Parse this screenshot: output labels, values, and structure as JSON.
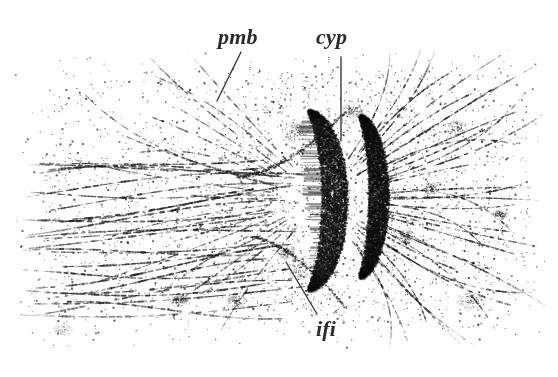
{
  "figure": {
    "kind": "stippled-histological-drawing",
    "width": 558,
    "height": 377,
    "background_color": "#ffffff",
    "ink_color": "#2b2b2b",
    "dark_mass_color": "#1a1a1a"
  },
  "labels": [
    {
      "id": "pmb",
      "text": "pmb",
      "x": 218,
      "y": 26,
      "leader": {
        "x1": 241,
        "y1": 52,
        "x2": 217,
        "y2": 101
      }
    },
    {
      "id": "cyp",
      "text": "cyp",
      "x": 316,
      "y": 26,
      "leader": {
        "x1": 341,
        "y1": 57,
        "x2": 341,
        "y2": 141
      }
    },
    {
      "id": "ifi",
      "text": "ifi",
      "x": 316,
      "y": 318,
      "leader": {
        "x1": 286,
        "y1": 262,
        "x2": 317,
        "y2": 314
      }
    }
  ],
  "regions": [
    {
      "name": "upper-left-stipple-field",
      "x": 30,
      "y": 60,
      "w": 240,
      "h": 110,
      "density": "sparse"
    },
    {
      "name": "left-fibre-bands",
      "x": 20,
      "y": 165,
      "w": 260,
      "h": 150,
      "density": "banded"
    },
    {
      "name": "central-dark-crescent",
      "x": 278,
      "y": 105,
      "w": 90,
      "h": 190,
      "density": "dense"
    },
    {
      "name": "right-radiating-fibres",
      "x": 360,
      "y": 75,
      "w": 190,
      "h": 230,
      "density": "radial"
    },
    {
      "name": "lower-margin-fade",
      "x": 0,
      "y": 330,
      "w": 558,
      "h": 47,
      "density": "fading"
    }
  ],
  "plate_geometry": {
    "seed": 20240517,
    "stipple_count": 5200,
    "fibre_band_count": 26,
    "radial_fibre_count": 34,
    "crescent_arcs": 2
  }
}
